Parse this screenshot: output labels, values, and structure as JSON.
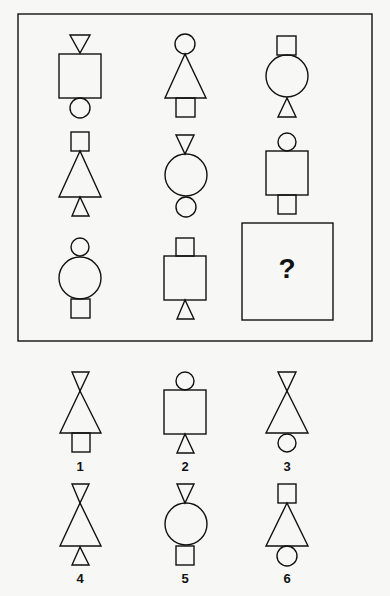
{
  "puzzle": {
    "question_mark": "?",
    "matrix": [
      {
        "row": 1,
        "col": 1,
        "top": "triangle-down",
        "middle": "square",
        "bottom": "circle"
      },
      {
        "row": 1,
        "col": 2,
        "top": "circle",
        "middle": "triangle-up",
        "bottom": "square"
      },
      {
        "row": 1,
        "col": 3,
        "top": "square",
        "middle": "circle",
        "bottom": "triangle-up"
      },
      {
        "row": 2,
        "col": 1,
        "top": "square",
        "middle": "triangle-up",
        "bottom": "triangle-up"
      },
      {
        "row": 2,
        "col": 2,
        "top": "triangle-down",
        "middle": "circle",
        "bottom": "circle"
      },
      {
        "row": 2,
        "col": 3,
        "top": "circle",
        "middle": "square",
        "bottom": "square"
      },
      {
        "row": 3,
        "col": 1,
        "top": "circle",
        "middle": "circle",
        "bottom": "square"
      },
      {
        "row": 3,
        "col": 2,
        "top": "square",
        "middle": "square",
        "bottom": "triangle-up"
      },
      {
        "row": 3,
        "col": 3,
        "missing": true
      }
    ],
    "options": [
      {
        "label": "1",
        "top": "triangle-down",
        "middle": "triangle-up",
        "bottom": "square"
      },
      {
        "label": "2",
        "top": "circle",
        "middle": "square",
        "bottom": "triangle-up"
      },
      {
        "label": "3",
        "top": "triangle-down",
        "middle": "triangle-up",
        "bottom": "circle"
      },
      {
        "label": "4",
        "top": "triangle-down",
        "middle": "triangle-up",
        "bottom": "triangle-up"
      },
      {
        "label": "5",
        "top": "triangle-down",
        "middle": "circle",
        "bottom": "square"
      },
      {
        "label": "6",
        "top": "square",
        "middle": "triangle-up",
        "bottom": "circle"
      }
    ]
  },
  "colors": {
    "stroke": "#111111",
    "background": "#f7f7f5"
  }
}
